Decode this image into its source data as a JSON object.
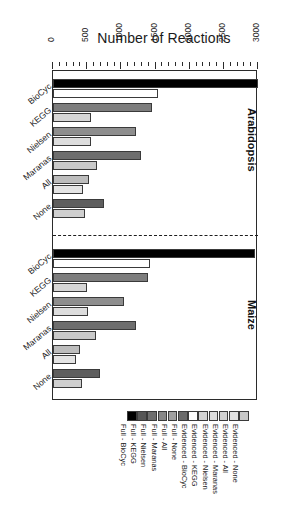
{
  "chart_data": {
    "type": "bar",
    "title": "Number of Reactions",
    "xlabel": "Number of Reactions",
    "ylabel": "",
    "orientation": "horizontal",
    "xlim": [
      0,
      3000
    ],
    "xticks": [
      0,
      500,
      1000,
      1500,
      2000,
      2500,
      3000
    ],
    "xtick_labels": [
      "0",
      "500",
      "1000",
      "1500",
      "2000",
      "2500",
      "3000"
    ],
    "minor_tick_step": 100,
    "grid": false,
    "legend_position": "bottom",
    "panels": [
      "Arabidopsis",
      "Maize"
    ],
    "categories": [
      "BioCyc",
      "KEGG",
      "Nielsen",
      "Maranas",
      "All",
      "None"
    ],
    "series": [
      {
        "name": "Full",
        "panel_values": {
          "Arabidopsis": [
            3000,
            1450,
            1210,
            1290,
            520,
            740
          ],
          "Maize": [
            2960,
            1390,
            1040,
            1220,
            400,
            690
          ]
        }
      },
      {
        "name": "Evidenced",
        "panel_values": {
          "Arabidopsis": [
            1530,
            560,
            560,
            640,
            440,
            470
          ],
          "Maize": [
            1420,
            500,
            510,
            630,
            330,
            430
          ]
        }
      }
    ],
    "legend": [
      {
        "label": "Full - BioCyc",
        "color": "#000000"
      },
      {
        "label": "Full - KEGG",
        "color": "#565656"
      },
      {
        "label": "Full - Nielsen",
        "color": "#6f6f6f"
      },
      {
        "label": "Full - Maranas",
        "color": "#878787"
      },
      {
        "label": "Full - All",
        "color": "#a0a0a0"
      },
      {
        "label": "Full - None",
        "color": "#6a6a6a"
      },
      {
        "label": "Evidenced - BioCyc",
        "color": "#ffffff"
      },
      {
        "label": "Evidenced - KEGG",
        "color": "#d4d4d4"
      },
      {
        "label": "Evidenced - Nielsen",
        "color": "#dcdcdc"
      },
      {
        "label": "Evidenced - Maranas",
        "color": "#d0d0d0"
      },
      {
        "label": "Evidenced - All",
        "color": "#e2e2e2"
      },
      {
        "label": "Evidenced - None",
        "color": "#c8c8c8"
      }
    ],
    "bar_colors": {
      "Arabidopsis": {
        "full": [
          "#000000",
          "#7d7d7d",
          "#8e8e8e",
          "#6e6e6e",
          "#bdbdbd",
          "#5e5e5e"
        ],
        "evidenced": [
          "#ffffff",
          "#d6d6d6",
          "#dddddd",
          "#c9c9c9",
          "#e4e4e4",
          "#cfcfcf"
        ]
      },
      "Maize": {
        "full": [
          "#000000",
          "#7d7d7d",
          "#8e8e8e",
          "#6e6e6e",
          "#bdbdbd",
          "#5e5e5e"
        ],
        "evidenced": [
          "#ffffff",
          "#d6d6d6",
          "#dddddd",
          "#c9c9c9",
          "#e4e4e4",
          "#cfcfcf"
        ]
      }
    }
  }
}
